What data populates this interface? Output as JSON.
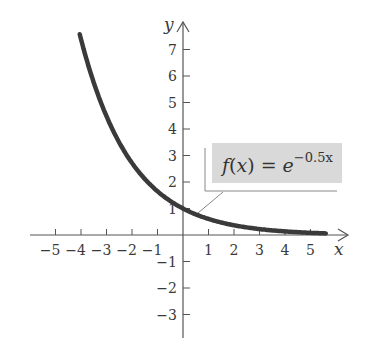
{
  "chart_data": {
    "type": "line",
    "title": "",
    "xlabel": "x",
    "ylabel": "y",
    "function": "f(x) = e^(-0.5x)",
    "annotation": {
      "lhs": "f(x) = e",
      "exponent": "−0.5x"
    },
    "xlim": [
      -5.5,
      6
    ],
    "ylim": [
      -4,
      8
    ],
    "x_ticks": [
      -5,
      -4,
      -3,
      -2,
      -1,
      1,
      2,
      3,
      4,
      5
    ],
    "x_tick_labels": [
      "−5",
      "−4",
      "−3",
      "−2",
      "−1",
      "1",
      "2",
      "3",
      "4",
      "5"
    ],
    "y_ticks": [
      -3,
      -2,
      -1,
      1,
      2,
      3,
      4,
      5,
      6,
      7
    ],
    "y_tick_labels": [
      "−3",
      "−2",
      "−1",
      "1",
      "2",
      "3",
      "4",
      "5",
      "6",
      "7"
    ],
    "grid": false,
    "series": [
      {
        "name": "f(x) = e^(-0.5x)",
        "x": [
          -4,
          -3.5,
          -3,
          -2.5,
          -2,
          -1.5,
          -1,
          -0.5,
          0,
          0.5,
          1,
          1.5,
          2,
          2.5,
          3,
          3.5,
          4,
          4.5,
          5,
          5.5
        ],
        "y": [
          7.39,
          5.75,
          4.48,
          3.49,
          2.72,
          2.12,
          1.65,
          1.28,
          1.0,
          0.78,
          0.61,
          0.47,
          0.37,
          0.29,
          0.22,
          0.17,
          0.14,
          0.11,
          0.08,
          0.06
        ]
      }
    ]
  },
  "colors": {
    "curve": "#3a3a3a",
    "axis": "#555555",
    "label_box_fill": "#d9d9d9"
  }
}
